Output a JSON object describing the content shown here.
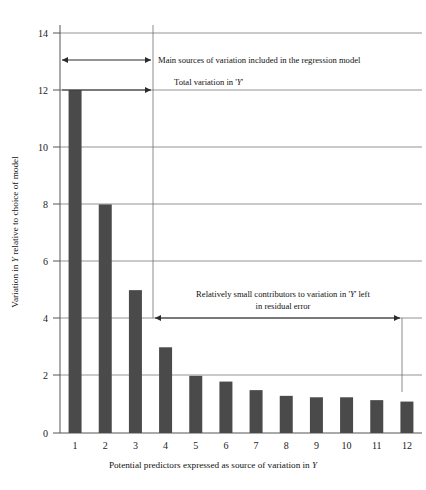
{
  "chart_data": {
    "type": "bar",
    "title": "",
    "subtitle": "",
    "xlabel": "Potential predictors expressed as source of variation in Y",
    "ylabel": "Variation in Y relative to choice of model",
    "categories": [
      "1",
      "2",
      "3",
      "4",
      "5",
      "6",
      "7",
      "8",
      "9",
      "10",
      "11",
      "12"
    ],
    "values": [
      12,
      8,
      5,
      3,
      2,
      1.8,
      1.5,
      1.3,
      1.25,
      1.25,
      1.15,
      1.1
    ],
    "ylim": [
      0,
      14
    ],
    "xlim_categories": 12,
    "yticks": [
      "0",
      "2",
      "4",
      "6",
      "8",
      "10",
      "12",
      "14"
    ],
    "ytick_values": [
      0,
      2,
      4,
      6,
      8,
      10,
      12,
      14
    ],
    "grid": "horizontal",
    "legend": "none",
    "bar_color": "#4a4a4a",
    "grid_color": "#7a7a7a",
    "axis_color": "#555555",
    "background_color": "#ffffff",
    "annotations": [
      {
        "id": "main-sources",
        "text": "Main sources of variation included in the regression model",
        "arrow": "double-headed",
        "from_category": "1",
        "to_category": "4",
        "at_y_value": 13.05
      },
      {
        "id": "total-variation",
        "text": "Total variation in 'Y'",
        "arrow": "single-headed",
        "from_category": "1",
        "to_category": "4",
        "at_y_value": 12
      },
      {
        "id": "residual-error",
        "text_line_1": "Relatively small contributors to variation in 'Y' left",
        "text_line_2": "in residual error",
        "arrow": "double-headed",
        "from_category": "4",
        "to_category": "12",
        "at_y_value": 4
      }
    ]
  },
  "axis_titles": {
    "y_prefix": "Variation in ",
    "y_italic": "Y",
    "y_suffix": " relative to choice of model",
    "x_prefix": "Potential predictors expressed as source of variation in ",
    "x_italic": "Y"
  },
  "annotation_text": {
    "main_sources": "Main sources of variation included in the regression model",
    "total_variation_prefix": "Total variation in '",
    "total_variation_italic": "Y",
    "total_variation_suffix": "'",
    "residual_line1_prefix": "Relatively small contributors to variation in '",
    "residual_line1_italic": "Y",
    "residual_line1_suffix": "' left",
    "residual_line2": "in residual error"
  }
}
